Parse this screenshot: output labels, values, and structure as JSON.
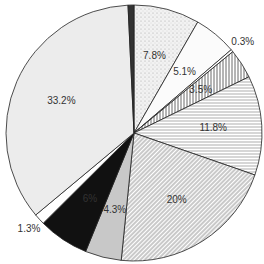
{
  "chart_data": {
    "type": "pie",
    "title": "",
    "start": "top",
    "direction": "clockwise",
    "slices": [
      {
        "label": "7.8%",
        "value": 7.8,
        "fill": "dots",
        "label_pos": "inside"
      },
      {
        "label": "5.1%",
        "value": 5.1,
        "fill": "light",
        "label_pos": "inside"
      },
      {
        "label": "0.3%",
        "value": 0.3,
        "fill": "white",
        "label_pos": "outside"
      },
      {
        "label": "3.5%",
        "value": 3.5,
        "fill": "vlines",
        "label_pos": "inside"
      },
      {
        "label": "11.8%",
        "value": 11.8,
        "fill": "hlines",
        "label_pos": "inside"
      },
      {
        "label": "20%",
        "value": 20,
        "fill": "diag",
        "label_pos": "inside"
      },
      {
        "label": "4.3%",
        "value": 4.3,
        "fill": "gray",
        "label_pos": "inside"
      },
      {
        "label": "6%",
        "value": 6,
        "fill": "black",
        "label_pos": "inside"
      },
      {
        "label": "1.3%",
        "value": 1.3,
        "fill": "white",
        "label_pos": "outside"
      },
      {
        "label": "33.2%",
        "value": 33.2,
        "fill": "lightgray",
        "label_pos": "inside"
      },
      {
        "label": "",
        "value": 0.7,
        "fill": "dark",
        "label_pos": "none"
      }
    ]
  }
}
